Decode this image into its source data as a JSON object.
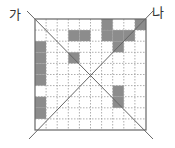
{
  "labels": {
    "left": "가",
    "right": "나"
  },
  "grid": {
    "rows": 10,
    "cols": 10,
    "shaded_color": "#8c8c8c",
    "line_color": "#9a9a9a",
    "border_color": "#666666",
    "shaded_cells": [
      [
        0,
        6
      ],
      [
        0,
        9
      ],
      [
        1,
        3
      ],
      [
        1,
        4
      ],
      [
        1,
        6
      ],
      [
        1,
        7
      ],
      [
        1,
        8
      ],
      [
        2,
        0
      ],
      [
        2,
        7
      ],
      [
        3,
        0
      ],
      [
        3,
        3
      ],
      [
        4,
        0
      ],
      [
        5,
        0
      ],
      [
        6,
        7
      ],
      [
        7,
        0
      ],
      [
        7,
        7
      ],
      [
        8,
        0
      ]
    ]
  },
  "diagonals": [
    {
      "name": "diagonal-ga",
      "from": "top-left",
      "to": "bottom-right"
    },
    {
      "name": "diagonal-na",
      "from": "top-right",
      "to": "bottom-left"
    }
  ]
}
